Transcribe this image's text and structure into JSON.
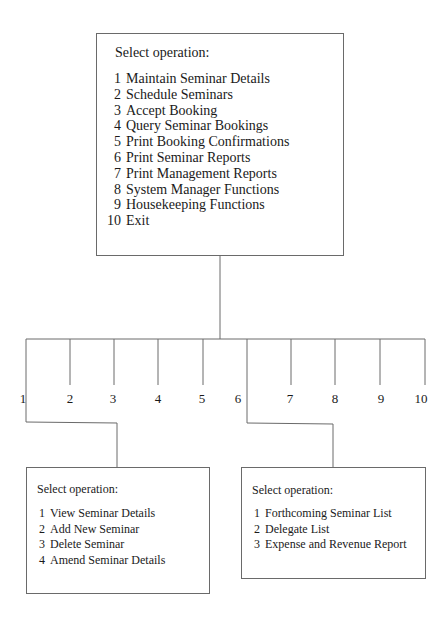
{
  "main_menu": {
    "heading": "Select operation:",
    "items": [
      {
        "num": "1",
        "label": "Maintain Seminar Details"
      },
      {
        "num": "2",
        "label": "Schedule Seminars"
      },
      {
        "num": "3",
        "label": "Accept Booking"
      },
      {
        "num": "4",
        "label": "Query Seminar Bookings"
      },
      {
        "num": "5",
        "label": "Print Booking Confirmations"
      },
      {
        "num": "6",
        "label": "Print Seminar Reports"
      },
      {
        "num": "7",
        "label": "Print Management Reports"
      },
      {
        "num": "8",
        "label": "System Manager Functions"
      },
      {
        "num": "9",
        "label": "Housekeeping Functions"
      },
      {
        "num": "10",
        "label": "Exit"
      }
    ]
  },
  "branches": [
    "1",
    "2",
    "3",
    "4",
    "5",
    "6",
    "7",
    "8",
    "9",
    "10"
  ],
  "submenu_1": {
    "parent_option": "1",
    "heading": "Select operation:",
    "items": [
      {
        "num": "1",
        "label": "View Seminar Details"
      },
      {
        "num": "2",
        "label": "Add New Seminar"
      },
      {
        "num": "3",
        "label": "Delete Seminar"
      },
      {
        "num": "4",
        "label": "Amend Seminar Details"
      }
    ]
  },
  "submenu_6": {
    "parent_option": "6",
    "heading": "Select operation:",
    "items": [
      {
        "num": "1",
        "label": "Forthcoming Seminar List"
      },
      {
        "num": "2",
        "label": "Delegate List"
      },
      {
        "num": "3",
        "label": "Expense and Revenue Report"
      }
    ]
  },
  "colors": {
    "line": "#6a6a6a",
    "text": "#1a1a1a",
    "background": "#ffffff"
  }
}
